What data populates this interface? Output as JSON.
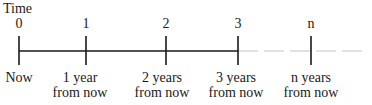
{
  "title": "Time",
  "timeline": {
    "solid_line": {
      "x1": 19,
      "x2": 238,
      "y": 51,
      "color": "#1a1a1a"
    },
    "dashed_line": {
      "x1": 238,
      "x2": 368,
      "y": 51,
      "color": "#c8c8c8"
    },
    "ticks": [
      {
        "x": 19,
        "top_label": "0",
        "bottom_label_line1": "Now",
        "bottom_label_line2": ""
      },
      {
        "x": 86,
        "top_label": "1",
        "bottom_label_line1": "1 year",
        "bottom_label_line2": "from now"
      },
      {
        "x": 166,
        "top_label": "2",
        "bottom_label_line1": "2 years",
        "bottom_label_line2": "from now"
      },
      {
        "x": 238,
        "top_label": "3",
        "bottom_label_line1": "3 years",
        "bottom_label_line2": "from now"
      },
      {
        "x": 311,
        "top_label": "n",
        "bottom_label_line1": "n years",
        "bottom_label_line2": "from now"
      }
    ]
  }
}
